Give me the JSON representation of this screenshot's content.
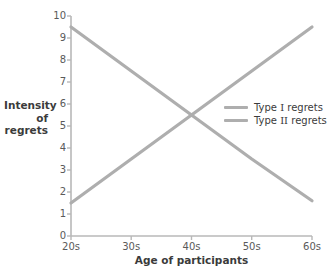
{
  "chart_data": {
    "type": "line",
    "title": "",
    "xlabel": "Age of participants",
    "ylabel": "Intensity of regrets",
    "ylabel_lines": [
      "Intensity",
      "of",
      "regrets"
    ],
    "categories": [
      "20s",
      "30s",
      "40s",
      "50s",
      "60s"
    ],
    "x": [
      20,
      30,
      40,
      50,
      60
    ],
    "xlim": [
      20,
      60
    ],
    "ylim": [
      0,
      10
    ],
    "ytick_labels": [
      "0",
      "1",
      "2",
      "3",
      "4",
      "5",
      "6",
      "7",
      "8",
      "9",
      "10"
    ],
    "ytick_values": [
      0,
      1,
      2,
      3,
      4,
      5,
      6,
      7,
      8,
      9,
      10
    ],
    "grid": false,
    "legend_position": "center-right",
    "series": [
      {
        "name": "Type I regrets",
        "name_prefix": "Type ",
        "name_numeral": "I",
        "name_suffix": " regrets",
        "color": "#aeaeae",
        "values": [
          1.5,
          3.5,
          5.5,
          7.5,
          9.5
        ],
        "trend": "increasing"
      },
      {
        "name": "Type II regrets",
        "name_prefix": "Type ",
        "name_numeral": "II",
        "name_suffix": " regrets",
        "color": "#aeaeae",
        "values": [
          9.5,
          7.5,
          5.5,
          3.5,
          1.6
        ],
        "trend": "decreasing"
      }
    ],
    "crossing_point": {
      "x": "40s",
      "y": 5.5
    },
    "colors": {
      "background": "#ffffff",
      "axis": "#b8b8b8",
      "tick_label": "#5a5a5a",
      "axis_title": "#3b3b3b",
      "series_line": "#aeaeae"
    }
  }
}
